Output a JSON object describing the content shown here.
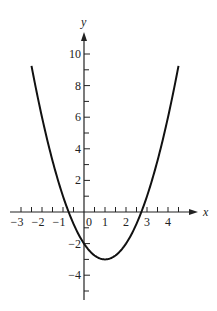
{
  "chart_data": {
    "type": "line",
    "title": "",
    "xlabel": "x",
    "ylabel": "y",
    "function": "y = x^2 - 2x - 2",
    "x_range_drawn": [
      -2.5,
      4.5
    ],
    "xlim": [
      -3.5,
      5.3
    ],
    "ylim": [
      -5.5,
      11.5
    ],
    "x_ticks_labeled": [
      -3,
      -2,
      -1,
      0,
      1,
      2,
      3,
      4
    ],
    "x_tick_labels": [
      "−3",
      "−2",
      "−1",
      "0",
      "1",
      "2",
      "3",
      "4"
    ],
    "x_minor_step": 0.5,
    "y_ticks_labeled": [
      -4,
      -2,
      2,
      4,
      6,
      8,
      10
    ],
    "y_tick_labels": [
      "−4",
      "−2",
      "2",
      "4",
      "6",
      "8",
      "10"
    ],
    "y_minor_step": 1,
    "grid": false,
    "legend": null,
    "key_points": {
      "vertex": [
        1,
        -3
      ],
      "y_intercept": [
        0,
        -2
      ],
      "x_intercepts": [
        -0.73,
        2.73
      ]
    },
    "series": [
      {
        "name": "parabola",
        "x": [
          -2.5,
          -2,
          -1.5,
          -1,
          -0.5,
          0,
          0.5,
          1,
          1.5,
          2,
          2.5,
          3,
          3.5,
          4,
          4.5
        ],
        "y": [
          9.25,
          6,
          3.25,
          1,
          -0.75,
          -2,
          -2.75,
          -3,
          -2.75,
          -2,
          -0.75,
          1,
          3.25,
          6,
          9.25
        ]
      }
    ],
    "style": {
      "curve_color": "#111111",
      "axis_color": "#222222"
    }
  },
  "layout": {
    "origin_px": [
      84,
      212
    ],
    "x_unit_px": 21,
    "y_unit_px": 15.8,
    "x_axis_px": [
      10,
      198
    ],
    "y_axis_px": [
      300,
      32
    ]
  }
}
